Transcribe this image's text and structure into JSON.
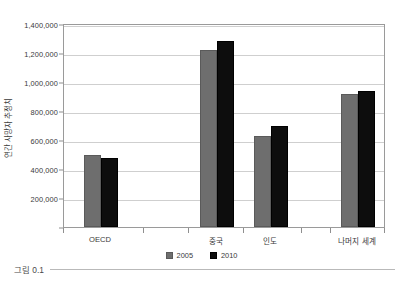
{
  "caption": {
    "text": "그림 0.1"
  },
  "chart_data": {
    "type": "bar",
    "title": "",
    "subtitle": "",
    "xlabel": "",
    "ylabel": "연간 사망자 추정치",
    "categories": [
      "OECD",
      "중국",
      "인도",
      "나머지 세계"
    ],
    "series": [
      {
        "name": "2005",
        "color": "#6e6e6e",
        "values": [
          497000,
          1220000,
          628000,
          918000
        ]
      },
      {
        "name": "2010",
        "color": "#0d0d0d",
        "values": [
          478000,
          1285000,
          700000,
          938000
        ]
      }
    ],
    "ylim": [
      0,
      1400000
    ],
    "ytick_values": [
      0,
      200000,
      400000,
      600000,
      800000,
      1000000,
      1200000,
      1400000
    ],
    "ytick_labels": [
      "0",
      "200,000",
      "400,000",
      "600,000",
      "800,000",
      "1,000,000",
      "1,200,000",
      "1,400,000"
    ],
    "grid": true,
    "grid_axis": "y",
    "legend_position": "bottom",
    "legend_entries": [
      "2005",
      "2010"
    ],
    "annotations": []
  }
}
